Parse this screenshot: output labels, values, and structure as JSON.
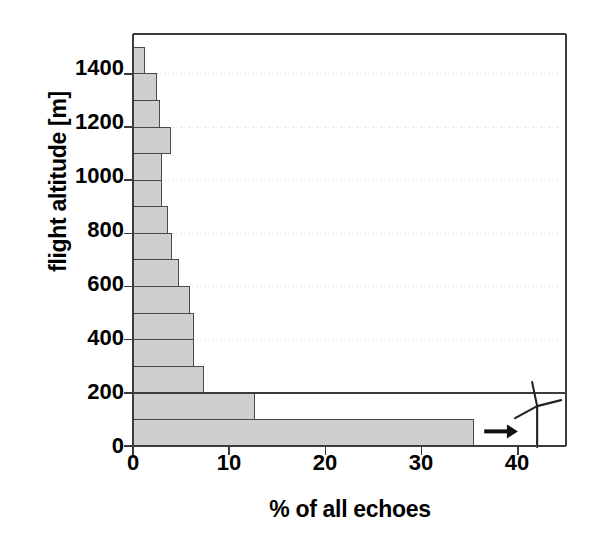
{
  "chart_data": {
    "type": "bar",
    "orientation": "horizontal",
    "title": "",
    "xlabel": "% of all echoes",
    "ylabel": "flight altitude [m]",
    "xlim": [
      0,
      45
    ],
    "ylim": [
      0,
      1550
    ],
    "xticks": [
      0,
      10,
      20,
      30,
      40
    ],
    "xtick_labels": [
      "0",
      "10",
      "20",
      "30",
      "40"
    ],
    "yticks": [
      0,
      200,
      400,
      600,
      800,
      1000,
      1200,
      1400
    ],
    "ytick_labels": [
      "0",
      "200",
      "400",
      "600",
      "800",
      "1000",
      "1200",
      "1400"
    ],
    "grid": "dotted-horizontal",
    "bin_width_m": 100,
    "categories": [
      "0-100",
      "100-200",
      "200-300",
      "300-400",
      "400-500",
      "500-600",
      "600-700",
      "700-800",
      "800-900",
      "900-1000",
      "1000-1100",
      "1100-1200",
      "1200-1300",
      "1300-1400",
      "1400-1500"
    ],
    "bin_lower_m": [
      0,
      100,
      200,
      300,
      400,
      500,
      600,
      700,
      800,
      900,
      1000,
      1100,
      1200,
      1300,
      1400
    ],
    "bin_upper_m": [
      100,
      200,
      300,
      400,
      500,
      600,
      700,
      800,
      900,
      1000,
      1100,
      1200,
      1300,
      1400,
      1500
    ],
    "values": [
      35.4,
      12.6,
      7.3,
      6.3,
      6.3,
      5.9,
      4.7,
      4.0,
      3.6,
      3.0,
      3.0,
      3.9,
      2.8,
      2.4,
      1.2
    ],
    "bar_fill_color": "#cfcfcf",
    "bar_edge_color": "#4a4a4a",
    "axis_color": "#3c3c3c",
    "grid_color": "#c8c8c8",
    "annotations": [
      {
        "name": "rotor-sweep-divider",
        "kind": "horizontal-line",
        "y_value_m": 200,
        "description": "line at 200 m separating rotor-height band"
      },
      {
        "name": "rotor-height-arrow",
        "kind": "arrow",
        "direction": "right",
        "y_value_m": 55,
        "x_start": 36.5,
        "x_end": 40.0,
        "glyph": "arrow-right-icon"
      },
      {
        "name": "wind-turbine",
        "kind": "icon",
        "glyph": "wind-turbine-icon",
        "x_value": 42.0,
        "description": "three-bladed wind turbine with tower inside the lowest band"
      }
    ]
  },
  "axes": {
    "ylabel": "flight altitude [m]",
    "xlabel": "% of all echoes"
  }
}
